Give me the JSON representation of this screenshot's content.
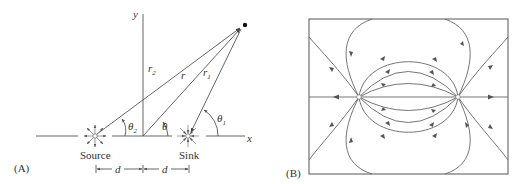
{
  "panelA": {
    "label": "(A)",
    "axis_x": "x",
    "axis_y": "y",
    "source_label": "Source",
    "sink_label": "Sink",
    "r2": "r",
    "r2_sub": "2",
    "r": "r",
    "r1": "r",
    "r1_sub": "1",
    "theta2": "θ",
    "theta2_sub": "2",
    "theta": "θ",
    "theta1": "θ",
    "theta1_sub": "1",
    "d_left": "d",
    "d_right": "d"
  },
  "panelB": {
    "label": "(B)",
    "description": "Streamlines of source–sink pair"
  },
  "colors": {
    "line": "#555555",
    "text": "#333333",
    "background": "#ffffff"
  }
}
